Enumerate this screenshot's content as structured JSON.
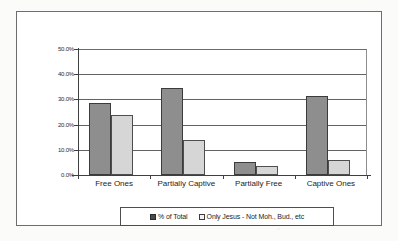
{
  "chart_data": {
    "type": "bar",
    "title": "",
    "xlabel": "",
    "ylabel": "",
    "categories": [
      "Free Ones",
      "Partially Captive",
      "Partially Free",
      "Captive Ones"
    ],
    "series": [
      {
        "name": "% of Total",
        "color": "#8e8e8e",
        "values": [
          28.4,
          34.4,
          5.0,
          31.3
        ]
      },
      {
        "name": "Only Jesus - Not Moh., Bud., etc",
        "color": "#d6d6d6",
        "values": [
          24.0,
          14.0,
          3.5,
          6.0
        ]
      }
    ],
    "ylim": [
      0,
      50
    ],
    "ytick_values": [
      50,
      40,
      30,
      20,
      10,
      0
    ],
    "ytick_labels": [
      "50.0%",
      "40.0%",
      "30.0%",
      "20.0%",
      "10.0%",
      "0.0%"
    ],
    "grid": true,
    "legend_position": "bottom"
  },
  "legend": {
    "items": [
      {
        "label": "% of Total"
      },
      {
        "label": "Only Jesus - Not Moh., Bud., etc"
      }
    ]
  }
}
